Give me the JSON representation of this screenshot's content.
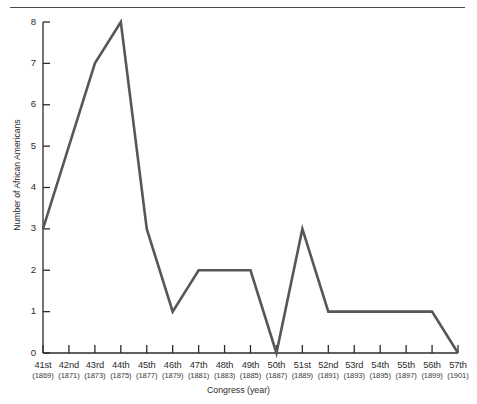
{
  "chart_data": {
    "type": "line",
    "title": "",
    "xlabel": "Congress (year)",
    "ylabel": "Number of African Americans",
    "categories": [
      "41st",
      "42nd",
      "43rd",
      "44th",
      "45th",
      "46th",
      "47th",
      "48th",
      "49th",
      "50th",
      "51st",
      "52nd",
      "53rd",
      "54th",
      "55th",
      "56th",
      "57th"
    ],
    "category_sublabels": [
      "(1869)",
      "(1871)",
      "(1873)",
      "(1875)",
      "(1877)",
      "(1879)",
      "(1881)",
      "(1883)",
      "(1885)",
      "(1887)",
      "(1889)",
      "(1891)",
      "(1893)",
      "(1895)",
      "(1897)",
      "(1899)",
      "(1901)"
    ],
    "values": [
      3,
      5,
      7,
      8,
      3,
      1,
      2,
      2,
      2,
      0,
      3,
      1,
      1,
      1,
      1,
      1,
      0
    ],
    "ylim": [
      0,
      8
    ],
    "ytick_labels": [
      "0",
      "1",
      "2",
      "3",
      "4",
      "5",
      "6",
      "7",
      "8"
    ],
    "grid": false,
    "legend": false,
    "line_color": "#575757",
    "axis_color": "#2b2b2b",
    "rule_color": "#4a4a4a"
  }
}
